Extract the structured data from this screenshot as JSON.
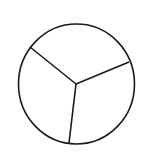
{
  "diagram": {
    "type": "circle-divided-into-sectors",
    "sector_count": 3,
    "stroke_color": "#1a1a1a",
    "background": "#ffffff",
    "circle": {
      "cx": 76.5,
      "cy": 84,
      "rx": 58,
      "ry": 60
    },
    "center": {
      "x": 76,
      "y": 84
    },
    "radii_endpoints": [
      {
        "x": 30,
        "y": 47
      },
      {
        "x": 129,
        "y": 62
      },
      {
        "x": 69,
        "y": 143
      }
    ],
    "labels": []
  }
}
